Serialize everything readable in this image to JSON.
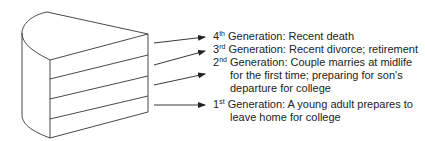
{
  "diagram": {
    "figure": "layer-cake",
    "layers": 4,
    "line_color": "#333333",
    "generations": [
      {
        "ordinal_num": "4",
        "ordinal_suffix": "th",
        "text": " Generation: Recent death",
        "continuation": []
      },
      {
        "ordinal_num": "3",
        "ordinal_suffix": "rd",
        "text": " Generation: Recent divorce; retirement",
        "continuation": []
      },
      {
        "ordinal_num": "2",
        "ordinal_suffix": "nd",
        "text": " Generation: Couple marries at midlife",
        "continuation": [
          "for the first time; preparing for son's",
          "departure for college"
        ]
      },
      {
        "ordinal_num": "1",
        "ordinal_suffix": "st",
        "text": " Generation: A young adult prepares to",
        "continuation": [
          "leave home for college"
        ]
      }
    ]
  }
}
